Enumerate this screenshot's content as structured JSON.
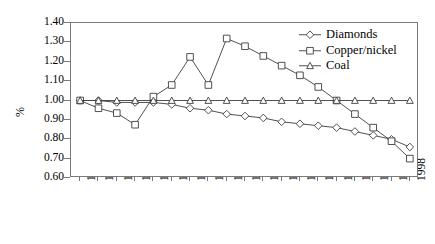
{
  "chart_data": {
    "type": "line",
    "title": "",
    "subtitle": "",
    "xlabel": "",
    "ylabel": "%",
    "ylim": [
      0.6,
      1.4
    ],
    "ytick_step": 0.1,
    "yticks": [
      "1.40",
      "1.30",
      "1.20",
      "1.10",
      "1.00",
      "0.90",
      "0.80",
      "0.70",
      "0.60"
    ],
    "ytick_values": [
      1.4,
      1.3,
      1.2,
      1.1,
      1.0,
      0.9,
      0.8,
      0.7,
      0.6
    ],
    "grid": false,
    "legend_position": "top-right",
    "categories": [
      "1980",
      "1981",
      "1982",
      "1983",
      "1984",
      "1985",
      "1986",
      "1987",
      "1988",
      "1989",
      "1990",
      "1991",
      "1992",
      "1993",
      "1994",
      "1995",
      "1996",
      "1997",
      "1998"
    ],
    "x": [
      1980,
      1981,
      1982,
      1983,
      1984,
      1985,
      1986,
      1987,
      1988,
      1989,
      1990,
      1991,
      1992,
      1993,
      1994,
      1995,
      1996,
      1997,
      1998
    ],
    "series": [
      {
        "name": "Diamonds",
        "marker": "diamond",
        "values": [
          1.0,
          1.0,
          0.99,
          0.99,
          0.99,
          0.98,
          0.96,
          0.95,
          0.93,
          0.92,
          0.91,
          0.89,
          0.88,
          0.87,
          0.86,
          0.84,
          0.82,
          0.8,
          0.76
        ]
      },
      {
        "name": "Copper/nickel",
        "marker": "square",
        "values": [
          1.0,
          0.96,
          0.935,
          0.875,
          1.02,
          1.08,
          1.225,
          1.08,
          1.32,
          1.28,
          1.23,
          1.18,
          1.13,
          1.07,
          1.0,
          0.93,
          0.86,
          0.79,
          0.7
        ]
      },
      {
        "name": "Coal",
        "marker": "triangle",
        "values": [
          1.0,
          1.0,
          1.0,
          1.0,
          1.0,
          1.0,
          1.0,
          1.0,
          1.0,
          1.0,
          1.0,
          1.0,
          1.0,
          1.0,
          1.0,
          1.0,
          1.0,
          1.0,
          1.0
        ]
      }
    ]
  },
  "legend": {
    "items": [
      {
        "label": "Diamonds",
        "marker": "diamond-marker-icon"
      },
      {
        "label": "Copper/nickel",
        "marker": "square-marker-icon"
      },
      {
        "label": "Coal",
        "marker": "triangle-marker-icon"
      }
    ]
  },
  "colors": {
    "line": "#3d3d3d",
    "axis": "#7a7a7a",
    "marker_fill": "#ffffff",
    "text": "#000000"
  }
}
